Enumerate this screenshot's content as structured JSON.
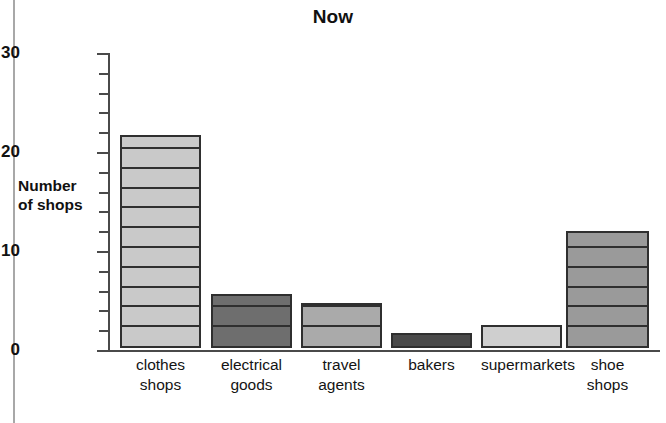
{
  "chart_data": {
    "type": "bar",
    "title": "Now",
    "xlabel": "",
    "ylabel": "Number of shops",
    "ylabel_lines": [
      "Number",
      "of shops"
    ],
    "categories": [
      "clothes shops",
      "electrical goods",
      "travel agents",
      "bakers",
      "supermarkets",
      "shoe shops"
    ],
    "category_lines": [
      [
        "clothes",
        "shops"
      ],
      [
        "electrical",
        "goods"
      ],
      [
        "travel",
        "agents"
      ],
      [
        "bakers",
        ""
      ],
      [
        "supermarkets",
        ""
      ],
      [
        "shoe",
        "shops"
      ]
    ],
    "values": [
      21.5,
      5.5,
      4.5,
      1.5,
      2.3,
      11.8
    ],
    "ylim": [
      0,
      30
    ],
    "y_tick_labels": [
      "0",
      "10",
      "20",
      "30"
    ],
    "y_major_ticks": [
      0,
      10,
      20,
      30
    ],
    "y_minor_tick_interval": 2,
    "grid": false,
    "legend": null,
    "bar_colors": [
      "#c9c9c9",
      "#6e6e6e",
      "#aaaaaa",
      "#4a4a4a",
      "#cfcfcf",
      "#9a9a9a"
    ],
    "bar_outline_color": "#2f2f2f",
    "internal_rule_interval": 2,
    "axis_color": "#4a4a4a"
  }
}
